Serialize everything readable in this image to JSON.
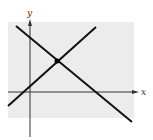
{
  "diagram": {
    "type": "two intersecting lines on coordinate axes",
    "axes": {
      "x_label": "x",
      "y_label": "y"
    },
    "colors": {
      "background_panel": "#ececec",
      "lines": "#111111",
      "axes": "#333333"
    },
    "lines": [
      {
        "name": "decreasing-line",
        "from": [
          16,
          26
        ],
        "to": [
          132,
          122
        ]
      },
      {
        "name": "increasing-line",
        "from": [
          8,
          106
        ],
        "to": [
          96,
          27
        ]
      }
    ],
    "intersection_point": [
      57,
      61
    ]
  }
}
